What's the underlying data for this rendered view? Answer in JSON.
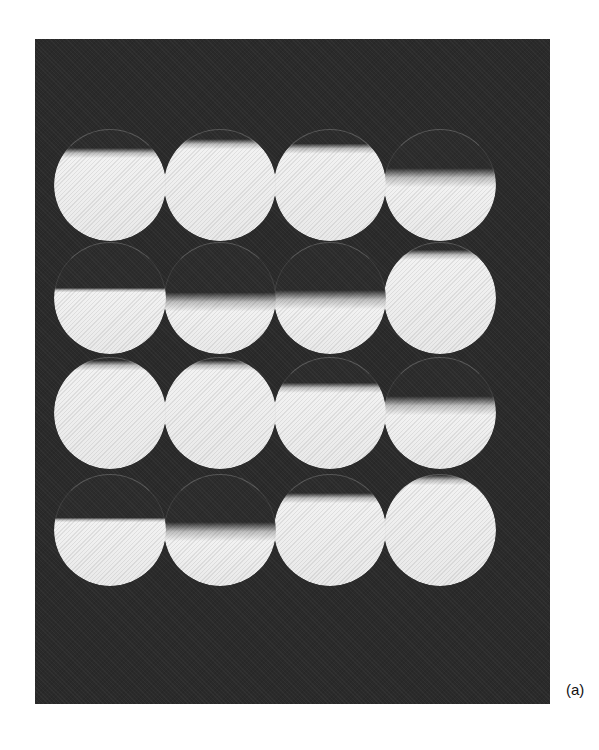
{
  "figure": {
    "panel_label": "(a)",
    "background_color": "#ffffff",
    "panel_color": "#2a2a2a",
    "sample_color": "#f2f2f2",
    "cap_color": "#2c2c2c",
    "grid": {
      "rows": 4,
      "cols": 4,
      "description": "4x4 grid of bright circular samples on a dark background, each with a dark top region (cap) of varying depth"
    },
    "cells": [
      {
        "row": 1,
        "col": 1,
        "cap_fraction": 0.18,
        "edge": "soft"
      },
      {
        "row": 1,
        "col": 2,
        "cap_fraction": 0.1,
        "edge": "soft"
      },
      {
        "row": 1,
        "col": 3,
        "cap_fraction": 0.14,
        "edge": "soft"
      },
      {
        "row": 1,
        "col": 4,
        "cap_fraction": 0.36,
        "edge": "diffuse"
      },
      {
        "row": 2,
        "col": 1,
        "cap_fraction": 0.42,
        "edge": "sharp"
      },
      {
        "row": 2,
        "col": 2,
        "cap_fraction": 0.46,
        "edge": "diffuse"
      },
      {
        "row": 2,
        "col": 3,
        "cap_fraction": 0.44,
        "edge": "diffuse"
      },
      {
        "row": 2,
        "col": 4,
        "cap_fraction": 0.08,
        "edge": "soft"
      },
      {
        "row": 3,
        "col": 1,
        "cap_fraction": 0.04,
        "edge": "soft"
      },
      {
        "row": 3,
        "col": 2,
        "cap_fraction": 0.04,
        "edge": "soft"
      },
      {
        "row": 3,
        "col": 3,
        "cap_fraction": 0.24,
        "edge": "soft"
      },
      {
        "row": 3,
        "col": 4,
        "cap_fraction": 0.36,
        "edge": "diffuse"
      },
      {
        "row": 4,
        "col": 1,
        "cap_fraction": 0.4,
        "edge": "sharp"
      },
      {
        "row": 4,
        "col": 2,
        "cap_fraction": 0.44,
        "edge": "diffuse"
      },
      {
        "row": 4,
        "col": 3,
        "cap_fraction": 0.18,
        "edge": "soft"
      },
      {
        "row": 4,
        "col": 4,
        "cap_fraction": 0.02,
        "edge": "soft"
      }
    ]
  }
}
